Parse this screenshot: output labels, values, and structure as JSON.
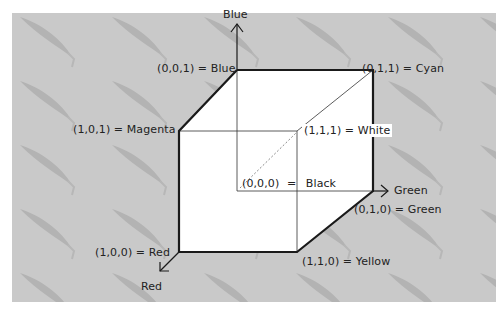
{
  "diagram": {
    "colors": {
      "page_background": "#ffffff",
      "panel_background": "#c9c9c9",
      "leaf_pattern": "#b3b3b3",
      "cube_face": "#ffffff",
      "edge": "#1a1a1a",
      "text": "#222222"
    },
    "axes": {
      "blue": {
        "label": "Blue"
      },
      "green": {
        "label": "Green"
      },
      "red": {
        "label": "Red"
      }
    },
    "vertices": {
      "black": {
        "coord": "(0,0,0)",
        "sep": "=",
        "name": "Black"
      },
      "blue": {
        "label": "(0,0,1) = Blue"
      },
      "cyan": {
        "label": "(0,1,1) = Cyan"
      },
      "magenta": {
        "label": "(1,0,1) = Magenta"
      },
      "white": {
        "label": "(1,1,1) = White"
      },
      "green": {
        "label": "(0,1,0) = Green"
      },
      "red": {
        "label": "(1,0,0) = Red"
      },
      "yellow": {
        "label": "(1,1,0) = Yellow"
      }
    }
  }
}
